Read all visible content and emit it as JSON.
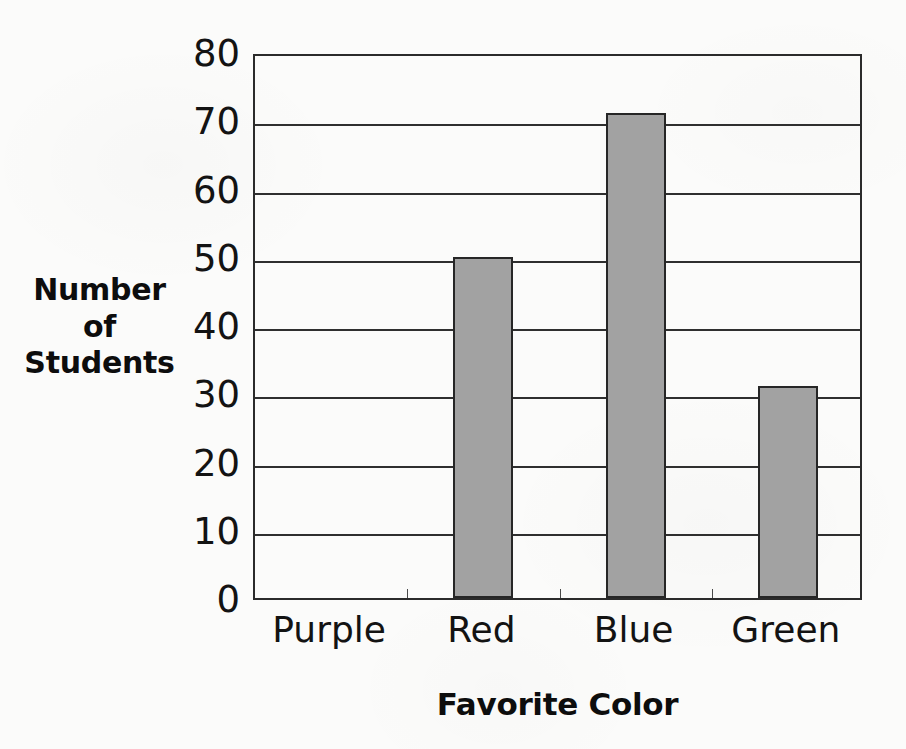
{
  "chart_data": {
    "type": "bar",
    "title": "",
    "categories": [
      "Purple",
      "Red",
      "Blue",
      "Green"
    ],
    "values": [
      0,
      50,
      71,
      31
    ],
    "series": [
      {
        "name": "Number of Students",
        "values": [
          0,
          50,
          71,
          31
        ]
      }
    ],
    "xlabel": "Favorite Color",
    "ylabel": "Number of Students",
    "ylabel_lines": [
      "Number",
      "of",
      "Students"
    ],
    "ylim": [
      0,
      80
    ],
    "ytick_values": [
      0,
      10,
      20,
      30,
      40,
      50,
      60,
      70,
      80
    ],
    "ytick_labels": [
      "0",
      "10",
      "20",
      "30",
      "40",
      "50",
      "60",
      "70",
      "80"
    ],
    "ytick_step": 10,
    "grid": true,
    "grid_axis": "y",
    "legend": false,
    "legend_position": "none",
    "bar_color": "#a2a2a2",
    "bar_edge_color": "#262626",
    "axis_color": "#2b2b2b",
    "background_color": "#fbfbfa",
    "text_color": "#131313",
    "bar_width_px": 60,
    "x_tick_marks": true
  }
}
